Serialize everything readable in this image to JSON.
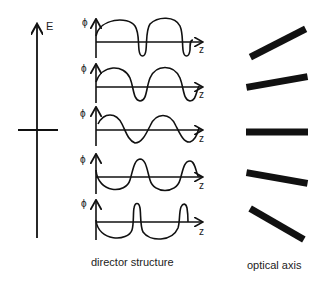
{
  "diagram": {
    "field_axis": {
      "label": "E"
    },
    "plots": [
      {
        "y_label": "ϕ",
        "x_label": "z",
        "shape": "wide-positive-humps-narrow-negative-dips"
      },
      {
        "y_label": "ϕ",
        "x_label": "z",
        "shape": "positive-biased-sine"
      },
      {
        "y_label": "ϕ",
        "x_label": "z",
        "shape": "symmetric-sine"
      },
      {
        "y_label": "ϕ",
        "x_label": "z",
        "shape": "negative-biased-sine"
      },
      {
        "y_label": "ϕ",
        "x_label": "z",
        "shape": "wide-negative-troughs-narrow-positive-peaks"
      }
    ],
    "optical_axis_bars": [
      {
        "angle_deg": -30
      },
      {
        "angle_deg": -10
      },
      {
        "angle_deg": 0
      },
      {
        "angle_deg": 10
      },
      {
        "angle_deg": 30
      }
    ],
    "captions": {
      "left": "director structure",
      "right": "optical axis"
    },
    "colors": {
      "ink": "#111111",
      "background": "#ffffff"
    }
  }
}
